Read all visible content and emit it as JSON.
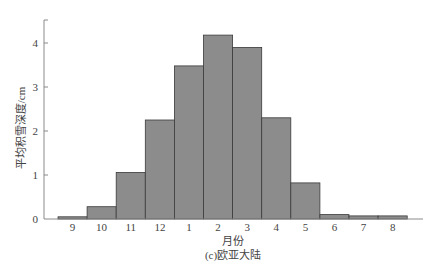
{
  "chart_data": {
    "type": "bar",
    "title": "",
    "caption": "(c)欧亚大陆",
    "xlabel": "月份",
    "ylabel": "平均积雪深度/cm",
    "categories": [
      "9",
      "10",
      "11",
      "12",
      "1",
      "2",
      "3",
      "4",
      "5",
      "6",
      "7",
      "8"
    ],
    "values": [
      0.05,
      0.28,
      1.06,
      2.25,
      3.48,
      4.18,
      3.9,
      2.3,
      0.82,
      0.1,
      0.07,
      0.07
    ],
    "yticks": [
      0,
      1,
      2,
      3,
      4
    ],
    "ylim": [
      0,
      4.5
    ],
    "grid": false,
    "legend": null
  },
  "style": {
    "bar_fill": "#8c8c8c",
    "bar_stroke": "#3a3a3a",
    "axis_color": "#8a8a8a",
    "text_color": "#444444"
  }
}
